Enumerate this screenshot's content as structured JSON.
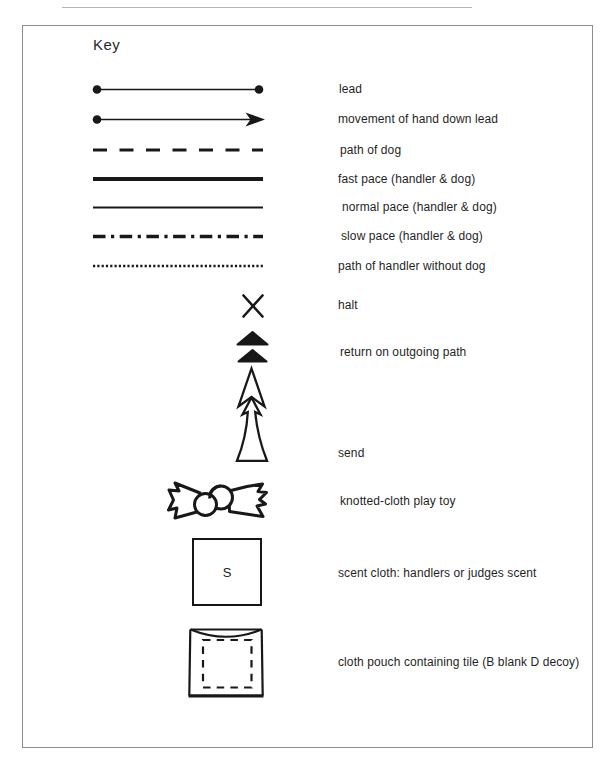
{
  "page": {
    "title": "Key"
  },
  "colors": {
    "ink": "#181818",
    "frame_border": "#8d8d8d",
    "background": "#ffffff"
  },
  "key": {
    "items": [
      {
        "id": "lead",
        "label": "lead",
        "symbol": "line-with-dots-both-ends"
      },
      {
        "id": "movement-of-hand-down-lead",
        "label": "movement of hand down lead",
        "symbol": "line-dot-to-arrowhead"
      },
      {
        "id": "path-of-dog",
        "label": "path of dog",
        "symbol": "dashed-line"
      },
      {
        "id": "fast-pace",
        "label": "fast pace (handler & dog)",
        "symbol": "thick-solid-line"
      },
      {
        "id": "normal-pace",
        "label": "normal pace (handler & dog)",
        "symbol": "thin-solid-line"
      },
      {
        "id": "slow-pace",
        "label": "slow pace (handler & dog)",
        "symbol": "dash-dot-line"
      },
      {
        "id": "path-of-handler-without-dog",
        "label": "path of handler without dog",
        "symbol": "dotted-line"
      },
      {
        "id": "halt",
        "label": "halt",
        "symbol": "x-mark"
      },
      {
        "id": "return-on-outgoing-path",
        "label": "return on outgoing path",
        "symbol": "two-stacked-filled-triangles"
      },
      {
        "id": "send",
        "label": "send",
        "symbol": "tall-outline-double-arrow-up"
      },
      {
        "id": "knotted-cloth-play-toy",
        "label": "knotted-cloth play toy",
        "symbol": "bow-with-center-knot"
      },
      {
        "id": "scent-cloth",
        "label": "scent cloth: handlers or judges scent",
        "symbol": "square-with-letter",
        "glyph": "S"
      },
      {
        "id": "cloth-pouch",
        "label": "cloth pouch containing tile (B blank D decoy)",
        "symbol": "pouch-with-dashed-square"
      }
    ]
  }
}
